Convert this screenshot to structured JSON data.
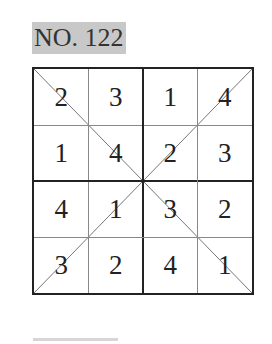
{
  "puzzle": {
    "title": "NO. 122",
    "grid": [
      [
        2,
        3,
        1,
        4
      ],
      [
        1,
        4,
        2,
        3
      ],
      [
        4,
        1,
        3,
        2
      ],
      [
        3,
        2,
        4,
        1
      ]
    ],
    "diagonals": true
  }
}
